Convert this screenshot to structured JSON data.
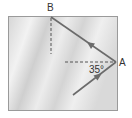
{
  "diagram": {
    "labels": {
      "point_b": "B",
      "point_a": "A",
      "angle": "35°"
    },
    "colors": {
      "surface": "#d8d8d8",
      "surface_light": "#efefef",
      "border": "#9a9a9a",
      "ray": "#6b6b6b",
      "dashed": "#555555",
      "text": "#333333"
    }
  }
}
